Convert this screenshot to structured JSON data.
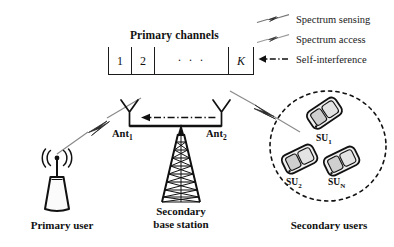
{
  "figure": {
    "title_primary_channels": "Primary channels",
    "type": "network-architecture-diagram"
  },
  "channels": {
    "label": "Primary channels",
    "cells": [
      "1",
      "2",
      "· · ·",
      "K"
    ]
  },
  "legend": {
    "items": [
      {
        "icon": "lightning-bolt-icon",
        "label": "Spectrum sensing"
      },
      {
        "icon": "lightning-bolt-icon",
        "label": "Spectrum access"
      },
      {
        "icon": "left-arrow-dashdot-icon",
        "label": "Self-interference"
      }
    ]
  },
  "primary_user": {
    "caption": "Primary user",
    "icon": "access-point-antenna-icon"
  },
  "base_station": {
    "caption_line1": "Secondary",
    "caption_line2": "base station",
    "icon": "lattice-tower-icon",
    "antennas": [
      {
        "name": "Ant",
        "sub": "1"
      },
      {
        "name": "Ant",
        "sub": "2"
      }
    ]
  },
  "secondary_users": {
    "caption": "Secondary users",
    "devices": [
      {
        "name": "SU",
        "sub": "1"
      },
      {
        "name": "SU",
        "sub": "2"
      },
      {
        "name": "SU",
        "sub": "N"
      }
    ]
  },
  "links": [
    {
      "name": "sensing-link",
      "from": "primary-user",
      "to": "Ant1",
      "style": "lightning"
    },
    {
      "name": "access-link",
      "from": "Ant2",
      "to": "secondary-users",
      "style": "lightning"
    },
    {
      "name": "self-interference-link",
      "from": "Ant2",
      "to": "Ant1",
      "style": "dash-dot-arrow"
    }
  ],
  "colors": {
    "stroke": "#1b1b1b",
    "light_stroke": "#6f6f6f",
    "fill_light": "#f2f2f2",
    "fill_mid": "#d8d8d8",
    "background": "#ffffff"
  }
}
